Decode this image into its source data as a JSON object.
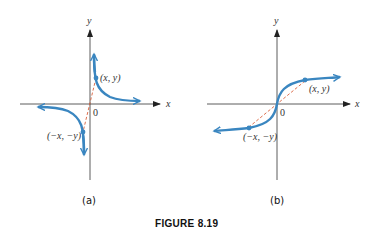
{
  "figure": {
    "caption": "FIGURE 8.19",
    "curve_color": "#3a86c0",
    "dash_color": "#d9603b",
    "axis_color": "#333333"
  },
  "panels": [
    {
      "id": "a",
      "sublabel": "(a)",
      "x_axis_label": "x",
      "y_axis_label": "y",
      "origin_label": "0",
      "point_label": "(x, y)",
      "reflected_point_label": "(−x, −y)",
      "curve_type": "reciprocal (odd function, hyperbola branches)"
    },
    {
      "id": "b",
      "sublabel": "(b)",
      "x_axis_label": "x",
      "y_axis_label": "y",
      "origin_label": "0",
      "point_label": "(x, y)",
      "reflected_point_label": "(−x, −y)",
      "curve_type": "cube-root-like (odd function through origin)"
    }
  ]
}
